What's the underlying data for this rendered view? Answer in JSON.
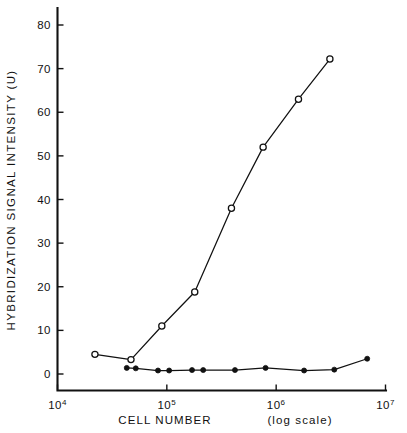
{
  "chart_data": {
    "type": "line",
    "title": "",
    "xlabel": "CELL NUMBER  (log scale)",
    "ylabel": "HYBRIDIZATION SIGNAL INTENSITY (U)",
    "xscale": "log",
    "yscale": "linear",
    "xlim": [
      10000,
      10000000
    ],
    "ylim": [
      0,
      85
    ],
    "grid": false,
    "legend": null,
    "xticks": [
      {
        "value": 10000,
        "base": "10",
        "exponent": "4",
        "label": "10^4"
      },
      {
        "value": 100000,
        "base": "10",
        "exponent": "5",
        "label": "10^5"
      },
      {
        "value": 1000000,
        "base": "10",
        "exponent": "6",
        "label": "10^6"
      },
      {
        "value": 10000000,
        "base": "10",
        "exponent": "7",
        "label": "10^7"
      }
    ],
    "yticks": [
      {
        "value": 0,
        "label": "0"
      },
      {
        "value": 10,
        "label": "10"
      },
      {
        "value": 20,
        "label": "20"
      },
      {
        "value": 30,
        "label": "30"
      },
      {
        "value": 40,
        "label": "40"
      },
      {
        "value": 50,
        "label": "50"
      },
      {
        "value": 60,
        "label": "60"
      },
      {
        "value": 70,
        "label": "70"
      },
      {
        "value": 80,
        "label": "80"
      }
    ],
    "series": [
      {
        "name": "open-circle-series",
        "marker": "open-circle",
        "color": "#111111",
        "points": [
          {
            "x": 22000,
            "y": 4.5
          },
          {
            "x": 47000,
            "y": 3.3
          },
          {
            "x": 90000,
            "y": 11.0
          },
          {
            "x": 180000,
            "y": 18.8
          },
          {
            "x": 390000,
            "y": 38.0
          },
          {
            "x": 760000,
            "y": 52.0
          },
          {
            "x": 1600000,
            "y": 63.0
          },
          {
            "x": 3100000,
            "y": 72.2
          }
        ]
      },
      {
        "name": "filled-circle-series",
        "marker": "filled-circle",
        "color": "#111111",
        "points": [
          {
            "x": 43000,
            "y": 1.4
          },
          {
            "x": 52000,
            "y": 1.3
          },
          {
            "x": 83000,
            "y": 0.8
          },
          {
            "x": 105000,
            "y": 0.8
          },
          {
            "x": 170000,
            "y": 0.9
          },
          {
            "x": 215000,
            "y": 0.9
          },
          {
            "x": 420000,
            "y": 0.9
          },
          {
            "x": 800000,
            "y": 1.4
          },
          {
            "x": 1800000,
            "y": 0.8
          },
          {
            "x": 3400000,
            "y": 1.0
          },
          {
            "x": 6800000,
            "y": 3.5
          }
        ]
      }
    ]
  },
  "axes": {
    "y_title": "HYBRIDIZATION SIGNAL INTENSITY (U)",
    "x_title_main": "CELL NUMBER",
    "x_title_paren": "(log scale)"
  }
}
